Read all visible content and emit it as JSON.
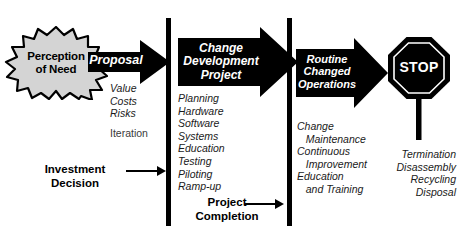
{
  "diagram": {
    "colors": {
      "ink": "#000000",
      "fill_black": "#000000",
      "starburst_fill": "#d4d4d4",
      "text_white": "#ffffff",
      "background": "#ffffff"
    },
    "start": {
      "shape": "starburst",
      "line1": "Perception",
      "line2": "of Need"
    },
    "stages": [
      {
        "id": "proposal",
        "arrow_label": "Proposal",
        "items": [
          "Value",
          "Costs",
          "Risks"
        ],
        "extra_items": [
          "Iteration"
        ]
      },
      {
        "id": "change-development-project",
        "arrow_label_lines": [
          "Change",
          "Development",
          "Project"
        ],
        "items": [
          "Planning",
          "Hardware",
          "Software",
          "Systems",
          "Education",
          "Testing",
          "Piloting",
          "Ramp-up"
        ]
      },
      {
        "id": "routine-changed-operations",
        "arrow_label_lines": [
          "Routine",
          "Changed",
          "Operations"
        ],
        "items": [
          "Change",
          "   Maintenance",
          "Continuous",
          "   Improvement",
          "Education",
          "   and Training"
        ]
      },
      {
        "id": "stop",
        "arrow_label": "STOP",
        "items": [
          "Termination",
          "Disassembly",
          "Recycling",
          "Disposal"
        ]
      }
    ],
    "gates": [
      {
        "id": "investment-decision",
        "line1": "Investment",
        "line2": "Decision"
      },
      {
        "id": "project-completion",
        "line1": "Project",
        "line2": "Completion"
      }
    ]
  }
}
